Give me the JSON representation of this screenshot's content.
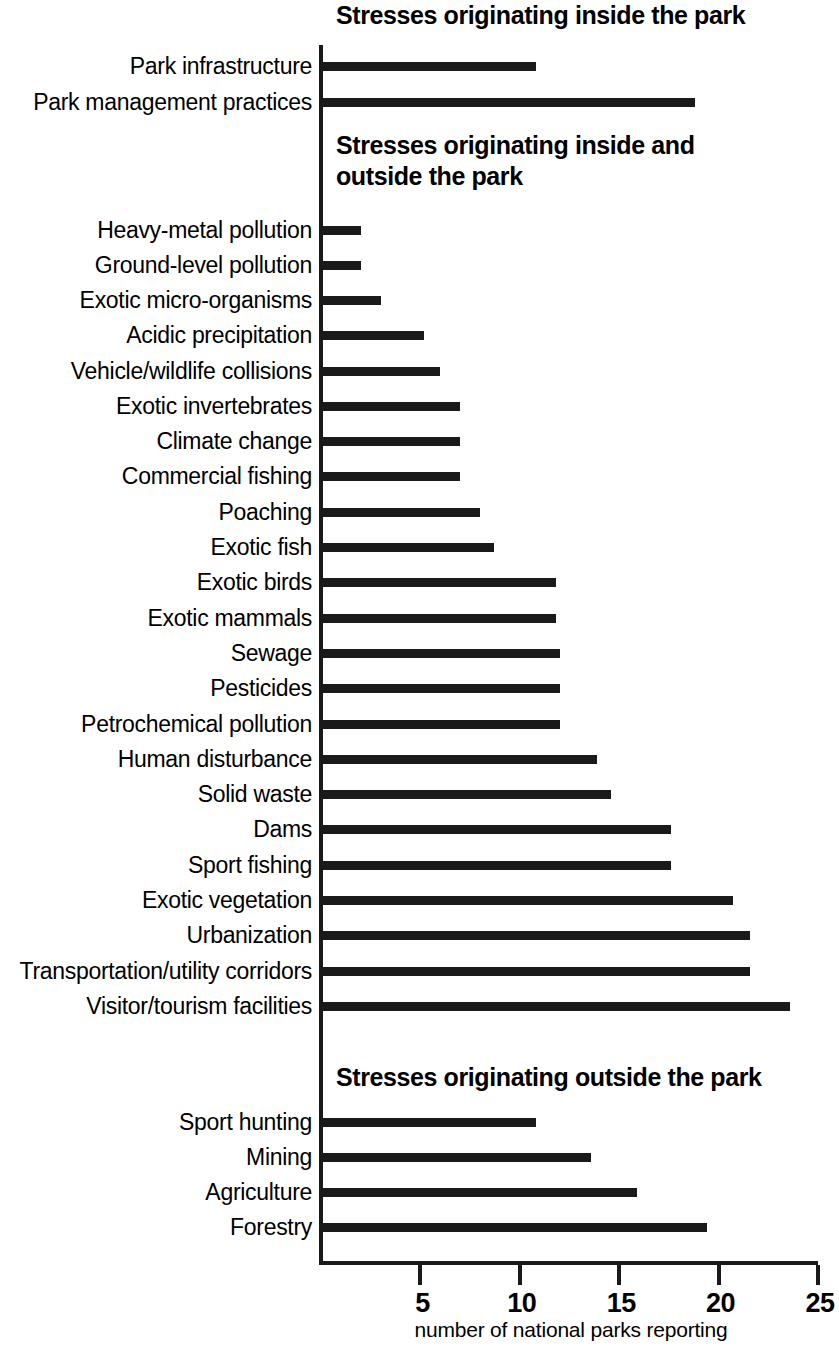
{
  "chart_data": {
    "type": "bar",
    "orientation": "horizontal",
    "title": "",
    "xlabel": "number of national parks reporting",
    "ylabel": "",
    "xlim": [
      0,
      25
    ],
    "xticks": [
      5,
      10,
      15,
      20,
      25
    ],
    "xtick_labels": [
      "5",
      "10",
      "15",
      "20",
      "25"
    ],
    "grid": false,
    "legend": null,
    "bar_color": "#1a1a1a",
    "sections": [
      {
        "heading": "Stresses originating inside the park",
        "categories": [
          "Park infrastructure",
          "Park management practices"
        ],
        "values": [
          10.8,
          18.8
        ]
      },
      {
        "heading": "Stresses originating inside and\noutside the park",
        "categories": [
          "Heavy-metal pollution",
          "Ground-level pollution",
          "Exotic micro-organisms",
          "Acidic precipitation",
          "Vehicle/wildlife collisions",
          "Exotic invertebrates",
          "Climate change",
          "Commercial fishing",
          "Poaching",
          "Exotic fish",
          "Exotic birds",
          "Exotic mammals",
          "Sewage",
          "Pesticides",
          "Petrochemical pollution",
          "Human disturbance",
          "Solid waste",
          "Dams",
          "Sport fishing",
          "Exotic vegetation",
          "Urbanization",
          "Transportation/utility corridors",
          "Visitor/tourism facilities"
        ],
        "values": [
          2,
          2,
          3,
          5.2,
          6,
          7,
          7,
          7,
          8,
          8.7,
          11.8,
          11.8,
          12,
          12,
          12,
          13.9,
          14.6,
          17.6,
          17.6,
          20.7,
          21.6,
          21.6,
          23.6
        ]
      },
      {
        "heading": "Stresses originating outside the park",
        "categories": [
          "Sport hunting",
          "Mining",
          "Agriculture",
          "Forestry"
        ],
        "values": [
          10.8,
          13.6,
          15.9,
          19.4
        ]
      }
    ],
    "all_categories": [
      "Park infrastructure",
      "Park management practices",
      "Heavy-metal pollution",
      "Ground-level pollution",
      "Exotic micro-organisms",
      "Acidic precipitation",
      "Vehicle/wildlife collisions",
      "Exotic invertebrates",
      "Climate change",
      "Commercial fishing",
      "Poaching",
      "Exotic fish",
      "Exotic birds",
      "Exotic mammals",
      "Sewage",
      "Pesticides",
      "Petrochemical pollution",
      "Human disturbance",
      "Solid waste",
      "Dams",
      "Sport fishing",
      "Exotic vegetation",
      "Urbanization",
      "Transportation/utility corridors",
      "Visitor/tourism facilities",
      "Sport hunting",
      "Mining",
      "Agriculture",
      "Forestry"
    ],
    "all_values": [
      10.8,
      18.8,
      2,
      2,
      3,
      5.2,
      6,
      7,
      7,
      7,
      8,
      8.7,
      11.8,
      11.8,
      12,
      12,
      12,
      13.9,
      14.6,
      17.6,
      17.6,
      20.7,
      21.6,
      21.6,
      23.6,
      10.8,
      13.6,
      15.9,
      19.4
    ]
  },
  "layout": {
    "row_tops": [
      62,
      98,
      226,
      261,
      296,
      331,
      367,
      402,
      437,
      472,
      508,
      543,
      578,
      614,
      649,
      684,
      720,
      755,
      790,
      825,
      861,
      896,
      931,
      967,
      1002,
      1118,
      1153,
      1188,
      1223
    ]
  }
}
